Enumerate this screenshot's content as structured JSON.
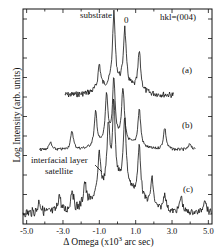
{
  "chart_data": {
    "type": "line",
    "title": "",
    "xlabel": "Δ Omega (x10^3 arc sec)",
    "ylabel": "Log Intensity (arb. units)",
    "xlim": [
      -5.2,
      5.2
    ],
    "x_ticks": [
      "-5.0",
      "-3.0",
      "-1.0",
      "1.0",
      "3.0",
      "5.0"
    ],
    "grid": false,
    "y_scale": "log (arbitrary, offset curves)",
    "reflection": "hkl=(004)",
    "annotations": [
      {
        "text": "substrate",
        "x": -0.2,
        "curve": "a"
      },
      {
        "text": "0",
        "x": 0.4,
        "curve": "a"
      },
      {
        "text": "interfacial layer satellite",
        "x": -1.0,
        "curve": "c"
      }
    ],
    "series": [
      {
        "name": "(a)",
        "x_range": [
          -2.9,
          3.1
        ],
        "peaks": [
          {
            "x": -1.0,
            "rel_height": 0.35
          },
          {
            "x": -0.2,
            "rel_height": 1.0,
            "label": "substrate"
          },
          {
            "x": 0.4,
            "rel_height": 0.8,
            "label": "0"
          },
          {
            "x": 1.2,
            "rel_height": 0.55
          }
        ]
      },
      {
        "name": "(b)",
        "x_range": [
          -4.3,
          4.3
        ],
        "peaks": [
          {
            "x": -3.7,
            "rel_height": 0.12
          },
          {
            "x": -2.5,
            "rel_height": 0.3
          },
          {
            "x": -1.2,
            "rel_height": 0.55
          },
          {
            "x": -0.6,
            "rel_height": 0.75
          },
          {
            "x": -0.2,
            "rel_height": 1.0
          },
          {
            "x": 0.3,
            "rel_height": 0.85
          },
          {
            "x": 1.2,
            "rel_height": 0.6
          },
          {
            "x": 2.6,
            "rel_height": 0.35
          },
          {
            "x": 4.0,
            "rel_height": 0.1
          }
        ]
      },
      {
        "name": "(c)",
        "x_range": [
          -5.2,
          5.2
        ],
        "peaks": [
          {
            "x": -4.3,
            "rel_height": 0.15
          },
          {
            "x": -3.2,
            "rel_height": 0.22
          },
          {
            "x": -2.5,
            "rel_height": 0.27
          },
          {
            "x": -1.8,
            "rel_height": 0.3
          },
          {
            "x": -1.0,
            "rel_height": 0.5,
            "label": "interfacial layer satellite"
          },
          {
            "x": -0.5,
            "rel_height": 0.75
          },
          {
            "x": -0.2,
            "rel_height": 1.0
          },
          {
            "x": 0.4,
            "rel_height": 0.85
          },
          {
            "x": 1.2,
            "rel_height": 0.65
          },
          {
            "x": 1.9,
            "rel_height": 0.35
          },
          {
            "x": 2.6,
            "rel_height": 0.22
          },
          {
            "x": 3.5,
            "rel_height": 0.2
          },
          {
            "x": 4.8,
            "rel_height": 0.18
          }
        ]
      }
    ]
  },
  "labels": {
    "substrate": "substrate",
    "zero": "0",
    "hkl": "hkl=(004)",
    "a": "(a)",
    "b": "(b)",
    "c": "(c)",
    "interfacial_line1": "interfacial layer",
    "interfacial_line2": "satellite",
    "ylabel": "Log Intensity (arb. units)",
    "xlabel_pre": "Δ Omega (x10",
    "xlabel_sup": "3",
    "xlabel_post": "  arc sec)"
  },
  "ticks": [
    "-5.0",
    "-3.0",
    "-1.0",
    "1.0",
    "3.0",
    "5.0"
  ]
}
